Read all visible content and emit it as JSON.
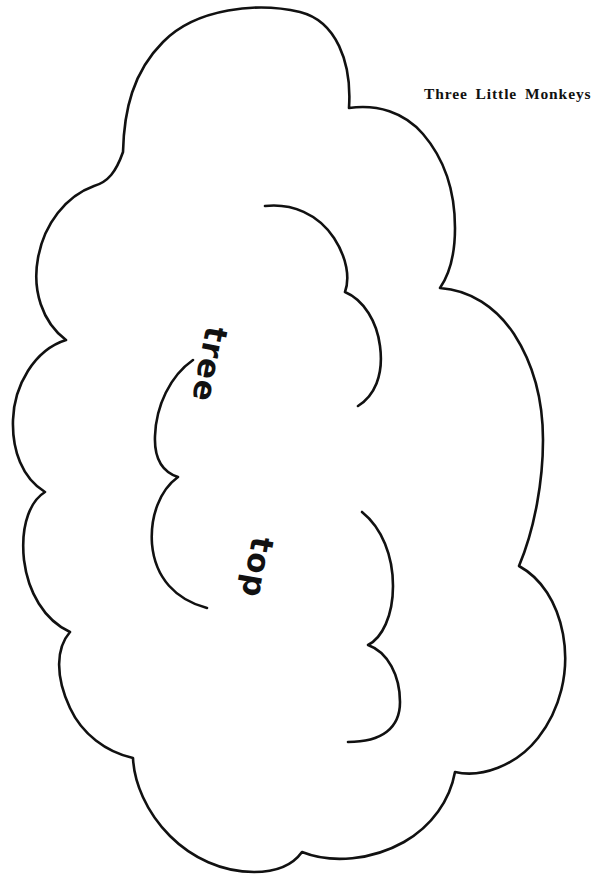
{
  "page": {
    "title_caption": "Three Little Monkeys",
    "background_color": "#ffffff",
    "ink_color": "#111111",
    "width": 578,
    "height": 891
  },
  "pattern": {
    "name": "tree-top-cloud-pattern",
    "description": "Hand-drawn scalloped cloud shape used as a craft cut-out pattern piece",
    "labels": [
      {
        "id": "tree",
        "text": "tree",
        "rotation_deg": 101,
        "x": 232,
        "y": 330
      },
      {
        "id": "top",
        "text": "top",
        "rotation_deg": 100,
        "x": 278,
        "y": 540
      }
    ],
    "outer_outline": {
      "name": "cloud-outer-outline",
      "stroke_width": 2.6,
      "d": "M 123 152 C 124 110 133 72 163 42 C 196 8 258 2 300 12 C 336 21 352 62 349 108 C 377 104 404 112 423 134 C 447 162 455 196 455 228 C 455 252 451 272 440 288 C 470 290 496 307 514 334 C 536 368 543 404 543 440 C 543 480 535 528 519 566 C 541 578 557 602 563 634 C 570 672 560 710 538 738 C 516 766 481 778 455 772 C 450 800 432 826 404 842 C 372 860 332 864 302 852 C 292 866 274 872 254 872 C 222 872 192 858 170 836 C 146 812 134 782 133 758 C 106 752 82 734 70 708 C 55 676 56 648 70 632 C 44 620 28 592 24 560 C 20 522 32 500 45 492 C 22 478 12 450 13 420 C 14 386 34 350 66 340 C 42 322 32 290 38 258 C 44 224 66 196 94 186 C 108 182 116 172 123 152 Z"
    },
    "inner_arcs": [
      {
        "name": "inner-arc-upper-right",
        "d": "M 265 206 C 292 203 318 214 334 238 C 347 258 350 278 345 292 C 364 300 377 322 380 346 C 384 376 374 396 358 406"
      },
      {
        "name": "inner-arc-left",
        "d": "M 193 360 C 170 376 156 406 155 436 C 154 460 163 472 178 477 C 160 490 150 516 152 544 C 155 578 176 600 207 608"
      },
      {
        "name": "inner-arc-lower-right",
        "d": "M 362 512 C 382 528 393 556 393 586 C 393 616 382 638 368 645 C 388 652 400 676 400 702 C 400 728 382 742 348 742"
      }
    ]
  }
}
